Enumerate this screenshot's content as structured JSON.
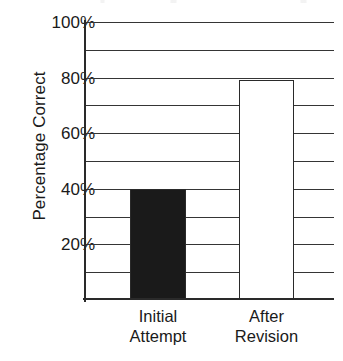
{
  "chart_data": {
    "type": "bar",
    "title": "",
    "subtitle": "",
    "xlabel": "",
    "ylabel": "Percentage Correct",
    "categories": [
      "Initial\nAttempt",
      "After\nRevision"
    ],
    "values": [
      40,
      79
    ],
    "value_labels": [
      "40%",
      "79%"
    ],
    "series": [
      {
        "name": "Percentage Correct",
        "values": [
          40,
          79
        ],
        "colors": [
          "#1a1a1a",
          "#ffffff"
        ]
      }
    ],
    "ylim": [
      0,
      100
    ],
    "ytick_values": [
      20,
      40,
      60,
      80,
      100
    ],
    "ytick_labels": [
      "20%",
      "40%",
      "60%",
      "80%",
      "100%"
    ],
    "gridline_values": [
      10,
      20,
      30,
      40,
      50,
      60,
      70,
      80,
      90,
      100
    ],
    "grid": true,
    "grid_axis": "y",
    "legend": false,
    "legend_position": "none",
    "annotations": [],
    "bar_colors": [
      "#1a1a1a",
      "#ffffff"
    ],
    "bar_edge_color": "#2a2a2a",
    "axis_color": "#2a2a2a",
    "grid_color": "#353535",
    "background_color": "#ffffff",
    "text_color": "#1a1a1a"
  },
  "y_axis": {
    "title": "Percentage Correct",
    "ticks": [
      {
        "label": "100%",
        "value": 100
      },
      {
        "label": "80%",
        "value": 80
      },
      {
        "label": "60%",
        "value": 60
      },
      {
        "label": "40%",
        "value": 40
      },
      {
        "label": "20%",
        "value": 20
      }
    ]
  },
  "x_axis": {
    "categories": [
      {
        "label": "Initial\nAttempt",
        "value": 40
      },
      {
        "label": "After\nRevision",
        "value": 79
      }
    ]
  }
}
